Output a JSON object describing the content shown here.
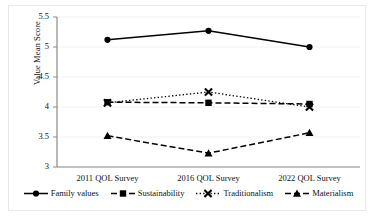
{
  "chart_data": {
    "type": "line",
    "title": "",
    "xlabel": "",
    "ylabel": "Value Mean Score",
    "categories": [
      "2011 QOL Survey",
      "2016 QOL Survey",
      "2022 QOL Survey"
    ],
    "ylim": [
      3,
      5.5
    ],
    "yticks": [
      "3",
      "3.5",
      "4",
      "4.5",
      "5",
      "5.5"
    ],
    "ytick_values": [
      3,
      3.5,
      4,
      4.5,
      5,
      5.5
    ],
    "grid": true,
    "grid_color": "#f2f2f2",
    "legend_position": "bottom",
    "series": [
      {
        "name": "Family values",
        "values": [
          5.12,
          5.27,
          5.0
        ],
        "marker": "circle",
        "line_style": "solid",
        "color": "#000000"
      },
      {
        "name": "Sustainability",
        "values": [
          4.08,
          4.07,
          4.05
        ],
        "marker": "square",
        "line_style": "dashed",
        "color": "#000000"
      },
      {
        "name": "Traditionalism",
        "values": [
          4.07,
          4.25,
          4.0
        ],
        "marker": "x",
        "line_style": "dotted",
        "color": "#000000"
      },
      {
        "name": "Materialism",
        "values": [
          3.52,
          3.23,
          3.57
        ],
        "marker": "triangle",
        "line_style": "dashed",
        "color": "#000000"
      }
    ]
  }
}
